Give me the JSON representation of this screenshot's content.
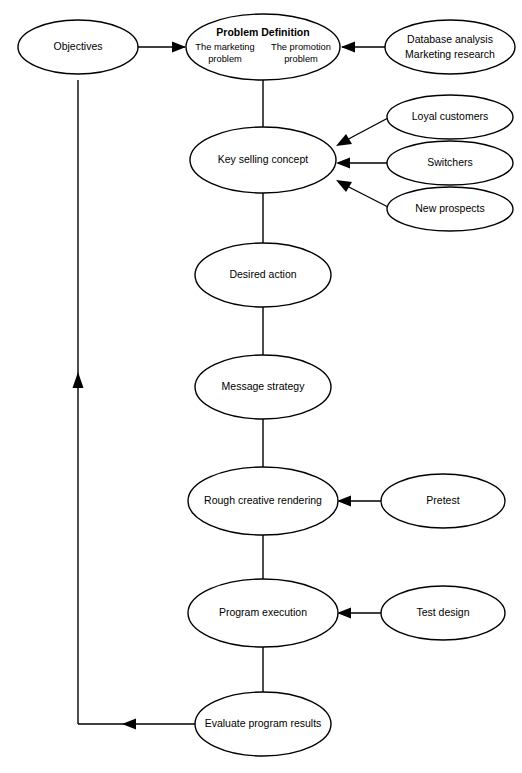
{
  "diagram": {
    "background_color": "#ffffff",
    "line_color": "#000000",
    "nodes": {
      "objectives": {
        "label": "Objectives"
      },
      "problem_definition": {
        "title": "Problem Definition",
        "left_line1": "The marketing",
        "left_line2": "problem",
        "right_line1": "The promotion",
        "right_line2": "problem"
      },
      "research": {
        "line1": "Database analysis",
        "line2": "Marketing research"
      },
      "key_selling_concept": {
        "label": "Key selling concept"
      },
      "loyal_customers": {
        "label": "Loyal customers"
      },
      "switchers": {
        "label": "Switchers"
      },
      "new_prospects": {
        "label": "New prospects"
      },
      "desired_action": {
        "label": "Desired action"
      },
      "message_strategy": {
        "label": "Message strategy"
      },
      "rough_creative_rendering": {
        "label": "Rough creative rendering"
      },
      "pretest": {
        "label": "Pretest"
      },
      "program_execution": {
        "label": "Program execution"
      },
      "test_design": {
        "label": "Test design"
      },
      "evaluate_program_results": {
        "label": "Evaluate program results"
      }
    }
  }
}
